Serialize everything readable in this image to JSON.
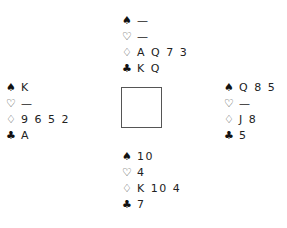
{
  "suit_symbols": {
    "spades": "♠",
    "hearts": "♡",
    "diamonds": "♢",
    "clubs": "♣"
  },
  "hands": {
    "north": {
      "spades": "—",
      "hearts": "—",
      "diamonds": "A Q 7 3",
      "clubs": "K Q"
    },
    "west": {
      "spades": "K",
      "hearts": "—",
      "diamonds": "9 6 5 2",
      "clubs": "A"
    },
    "east": {
      "spades": "Q 8 5",
      "hearts": "—",
      "diamonds": "J 8",
      "clubs": "5"
    },
    "south": {
      "spades": "10",
      "hearts": "4",
      "diamonds": "K 10 4",
      "clubs": "7"
    }
  }
}
